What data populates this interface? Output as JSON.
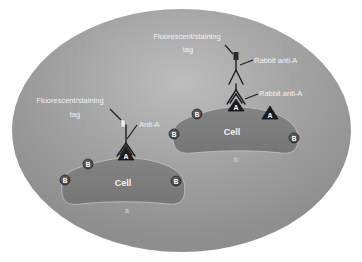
{
  "diagram": {
    "colors": {
      "page_background": "#ffffff",
      "ellipse_fill": "#9c9c9c",
      "ellipse_highlight": "#bdbdbd",
      "cell_fill": "#7d7d7d",
      "cell_outline": "#c4c4c4",
      "antigen_b_fill": "#5a5a5a",
      "antigen_a_fill": "#1c1c1c",
      "label_text": "#f2f2f2"
    },
    "panel_a": {
      "caption": "a",
      "cell_label": "Cell",
      "tag_label_line1": "Fluorescent/staining",
      "tag_label_line2": "tag",
      "antibody_label": "Anti-A",
      "antigens": [
        {
          "type": "B",
          "label": "B"
        },
        {
          "type": "B",
          "label": "B"
        },
        {
          "type": "A",
          "label": "A"
        },
        {
          "type": "B",
          "label": "B"
        }
      ]
    },
    "panel_b": {
      "caption": "b",
      "cell_label": "Cell",
      "tag_label_line1": "Fluorescent/staining",
      "tag_label_line2": "tag",
      "secondary_antibody_label": "Rabbit anti-A",
      "primary_antibody_label": "Rabbit anti-A",
      "antigens": [
        {
          "type": "B",
          "label": "B"
        },
        {
          "type": "B",
          "label": "B"
        },
        {
          "type": "A",
          "label": "A"
        },
        {
          "type": "A",
          "label": "A"
        },
        {
          "type": "B",
          "label": "B"
        }
      ]
    }
  }
}
